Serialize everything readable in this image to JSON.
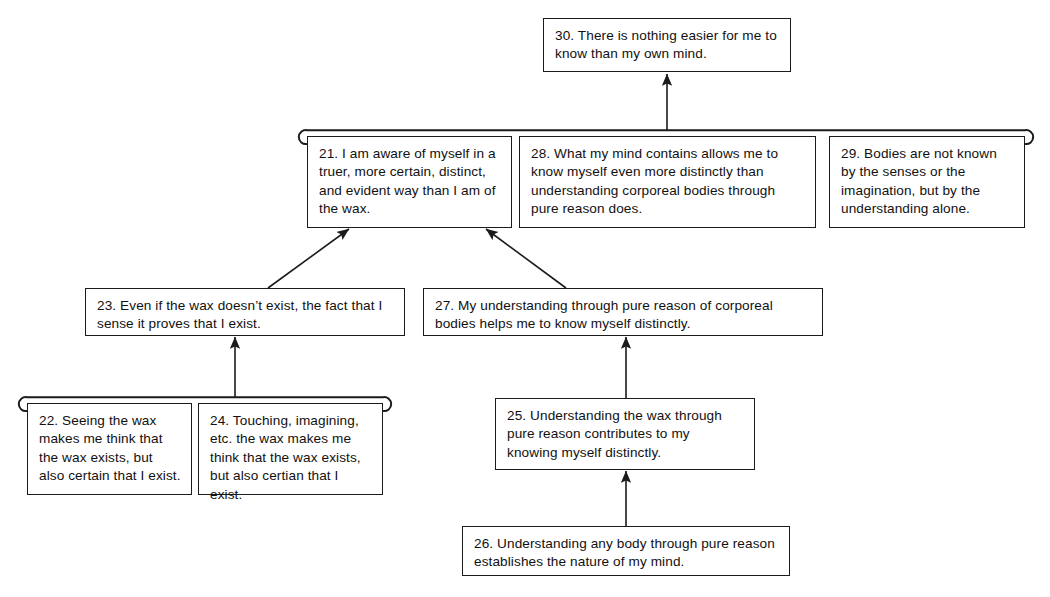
{
  "diagram": {
    "type": "argument-diagram",
    "background_color": "#ffffff",
    "line_color": "#1b1b1b",
    "text_color": "#111111"
  },
  "nodes": [
    {
      "id": "30",
      "label": "30. There is nothing easier for me to know than my own mind.",
      "x": 543,
      "y": 18,
      "w": 248,
      "h": 54,
      "role": "main-conclusion"
    },
    {
      "id": "21",
      "label": "21. I am aware of myself in a truer, more certain, distinct, and evident way than I am of the wax.",
      "x": 307,
      "y": 136,
      "w": 205,
      "h": 92,
      "role": "premise"
    },
    {
      "id": "28",
      "label": "28. What my mind contains allows me to know myself even more distinctly than understanding corporeal bodies through pure reason does.",
      "x": 519,
      "y": 136,
      "w": 297,
      "h": 92,
      "role": "premise"
    },
    {
      "id": "29",
      "label": "29. Bodies are not known by the senses or the imagination, but by the understanding alone.",
      "x": 829,
      "y": 136,
      "w": 196,
      "h": 92,
      "role": "premise"
    },
    {
      "id": "23",
      "label": "23. Even if the wax doesn’t exist, the fact that I sense it proves that I exist.",
      "x": 85,
      "y": 288,
      "w": 320,
      "h": 48,
      "role": "premise"
    },
    {
      "id": "27",
      "label": "27. My understanding through pure reason of corporeal bodies helps me to know myself distinctly.",
      "x": 423,
      "y": 288,
      "w": 400,
      "h": 48,
      "role": "premise"
    },
    {
      "id": "22",
      "label": "22. Seeing the wax makes me think that the wax exists, but also certain that I exist.",
      "x": 27,
      "y": 403,
      "w": 165,
      "h": 92,
      "role": "premise"
    },
    {
      "id": "24",
      "label": "24. Touching, imagining, etc. the wax makes me think that the wax exists, but also certian that I exist.",
      "x": 198,
      "y": 403,
      "w": 185,
      "h": 92,
      "role": "premise"
    },
    {
      "id": "25",
      "label": "25. Understanding the wax through pure reason contributes to my knowing myself distinctly.",
      "x": 495,
      "y": 398,
      "w": 260,
      "h": 72,
      "role": "premise"
    },
    {
      "id": "26",
      "label": "26. Understanding any body through pure reason establishes the nature of my mind.",
      "x": 462,
      "y": 526,
      "w": 328,
      "h": 50,
      "role": "premise"
    }
  ],
  "brackets": [
    {
      "name": "linked-premises-21-28-29",
      "members": [
        "21",
        "28",
        "29"
      ],
      "x1": 300,
      "x2": 1032,
      "y": 130
    },
    {
      "name": "linked-premises-22-24",
      "members": [
        "22",
        "24"
      ],
      "x1": 20,
      "x2": 390,
      "y": 397
    }
  ],
  "edges": [
    {
      "name": "bracket-21-28-29-to-30",
      "from": "linked-premises-21-28-29",
      "to": "30",
      "x1": 667,
      "y1": 130,
      "x2": 667,
      "y2": 74
    },
    {
      "name": "edge-23-to-21",
      "from": "23",
      "to": "21",
      "x1": 268,
      "y1": 288,
      "x2": 349,
      "y2": 229
    },
    {
      "name": "edge-27-to-21",
      "from": "27",
      "to": "21",
      "x1": 566,
      "y1": 288,
      "x2": 486,
      "y2": 229
    },
    {
      "name": "bracket-22-24-to-23",
      "from": "linked-premises-22-24",
      "to": "23",
      "x1": 235,
      "y1": 397,
      "x2": 235,
      "y2": 337
    },
    {
      "name": "edge-25-to-27",
      "from": "25",
      "to": "27",
      "x1": 626,
      "y1": 398,
      "x2": 626,
      "y2": 337
    },
    {
      "name": "edge-26-to-25",
      "from": "26",
      "to": "25",
      "x1": 626,
      "y1": 526,
      "x2": 626,
      "y2": 471
    }
  ]
}
